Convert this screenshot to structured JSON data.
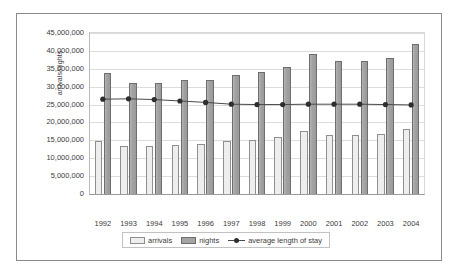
{
  "chart_data": {
    "type": "bar",
    "title": "",
    "subtitle": "",
    "xlabel": "",
    "ylabel": "arrivals/nights",
    "ylim": [
      0,
      45000000
    ],
    "ytick_step": 5000000,
    "grid": true,
    "legend_position": "bottom",
    "categories": [
      "1992",
      "1993",
      "1994",
      "1995",
      "1996",
      "1997",
      "1998",
      "1999",
      "2000",
      "2001",
      "2002",
      "2003",
      "2004"
    ],
    "ytick_labels": [
      "45,000,000",
      "40,000,000",
      "35,000,000",
      "30,000,000",
      "25,000,000",
      "20,000,000",
      "15,000,000",
      "10,000,000",
      "5,000,000",
      "0"
    ],
    "ytick_values": [
      45000000,
      40000000,
      35000000,
      30000000,
      25000000,
      20000000,
      15000000,
      10000000,
      5000000,
      0
    ],
    "series": [
      {
        "name": "arrivals",
        "kind": "bar",
        "color": "#eeeeee",
        "border_color": "#8f8f8f",
        "values": [
          14700000,
          13300000,
          13400000,
          13800000,
          14000000,
          14900000,
          15100000,
          15900000,
          17500000,
          16400000,
          16400000,
          16900000,
          18300000
        ]
      },
      {
        "name": "nights",
        "kind": "bar",
        "color": "#a4a4a4",
        "border_color": "#6e6e6e",
        "values": [
          33900000,
          31100000,
          31100000,
          31900000,
          32000000,
          33200000,
          34200000,
          35400000,
          39000000,
          37100000,
          37100000,
          37900000,
          41900000
        ]
      },
      {
        "name": "average length of stay",
        "kind": "line",
        "color": "#4a4a4a",
        "marker_color": "#2e2e2e",
        "values": [
          26500000,
          26600000,
          26400000,
          26000000,
          25600000,
          25100000,
          25000000,
          25000000,
          25100000,
          25100000,
          25100000,
          25000000,
          24900000
        ]
      }
    ]
  }
}
